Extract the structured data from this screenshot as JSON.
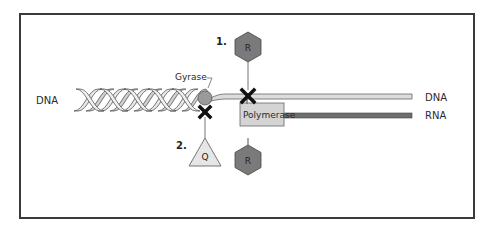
{
  "diagram": {
    "labels": {
      "dna_left": "DNA",
      "dna_right": "DNA",
      "rna_right": "RNA",
      "gyrase": "Gyrase",
      "polymerase": "Polymerase",
      "step1": "1.",
      "step2": "2.",
      "inhibitor_r_top": "R",
      "inhibitor_r_bottom": "R",
      "inhibitor_q": "Q"
    },
    "colors": {
      "frame": "#3a3a3a",
      "hexagon_fill": "#7a7a7a",
      "triangle_fill": "#e6e6e6",
      "polymerase_fill": "#d4d4d4",
      "gyrase_fill": "#9a9a9a",
      "dna_strand": "#c8c8c8",
      "rna_strand": "#6e6e6e",
      "block_mark": "#111111"
    }
  }
}
